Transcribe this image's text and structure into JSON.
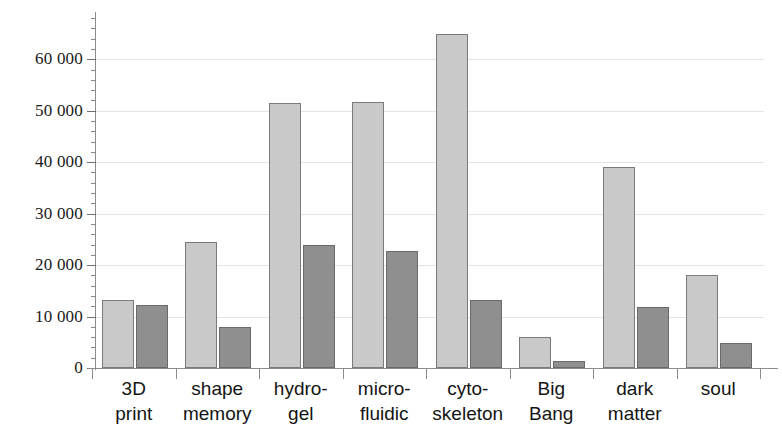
{
  "chart_data": {
    "type": "bar",
    "title": "",
    "xlabel": "",
    "ylabel": "",
    "ylim": [
      0,
      68000
    ],
    "grid": true,
    "legend": "none",
    "y_tick_step": 10000,
    "y_minor_step": 2000,
    "y_tick_labels": [
      "0",
      "10 000",
      "20 000",
      "30 000",
      "40 000",
      "50 000",
      "60 000"
    ],
    "y_tick_values": [
      0,
      10000,
      20000,
      30000,
      40000,
      50000,
      60000
    ],
    "categories": [
      {
        "line1": "3D",
        "line2": "print"
      },
      {
        "line1": "shape",
        "line2": "memory"
      },
      {
        "line1": "hydro-",
        "line2": "gel"
      },
      {
        "line1": "micro-",
        "line2": "fluidic"
      },
      {
        "line1": "cyto-",
        "line2": "skeleton"
      },
      {
        "line1": "Big",
        "line2": "Bang"
      },
      {
        "line1": "dark",
        "line2": "matter"
      },
      {
        "line1": "soul",
        "line2": ""
      }
    ],
    "series": [
      {
        "name": "series-light",
        "color": "#c9c9c9",
        "values": [
          13200,
          24500,
          51400,
          51700,
          64900,
          6000,
          39100,
          18000
        ]
      },
      {
        "name": "series-dark",
        "color": "#8f8f8f",
        "values": [
          12200,
          8000,
          23900,
          22700,
          13200,
          1300,
          11900,
          4900
        ]
      }
    ]
  },
  "style": {
    "gridline_color": "#e3e3e3",
    "axis_color": "#8d8d8d",
    "background": "#ffffff"
  }
}
